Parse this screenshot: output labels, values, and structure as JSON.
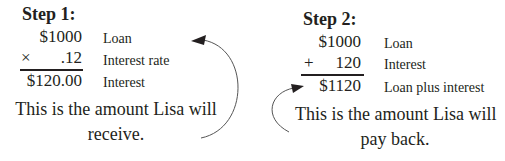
{
  "step1": {
    "title": "Step 1:",
    "rows": [
      {
        "operator": "",
        "value": "$1000",
        "label": "Loan"
      },
      {
        "operator": "×",
        "value": ".12",
        "label": "Interest rate"
      },
      {
        "operator": "",
        "value": "$120.00",
        "label": "Interest"
      }
    ],
    "note_line1": "This is the amount Lisa will",
    "note_line2": "receive."
  },
  "step2": {
    "title": "Step 2:",
    "rows": [
      {
        "operator": "",
        "value": "$1000",
        "label": "Loan"
      },
      {
        "operator": "+",
        "value": "120",
        "label": "Interest"
      },
      {
        "operator": "",
        "value": "$1120",
        "label": "Loan plus interest"
      }
    ],
    "note_line1": "This is the amount Lisa will",
    "note_line2": "pay back."
  },
  "colors": {
    "ink": "#231f20",
    "arrow": "#555555",
    "background": "#ffffff"
  }
}
